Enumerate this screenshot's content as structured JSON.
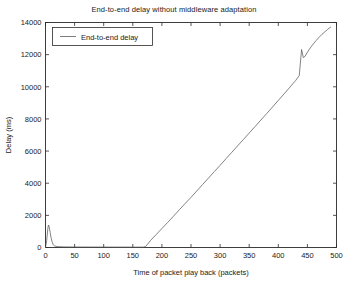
{
  "chart_data": {
    "type": "line",
    "title": "End-to-end delay without middleware adaptation",
    "xlabel": "Time of packet play back (packets)",
    "ylabel": "Delay (ms)",
    "xlim": [
      0,
      500
    ],
    "ylim": [
      0,
      14000
    ],
    "xticks": [
      0,
      50,
      100,
      150,
      200,
      250,
      300,
      350,
      400,
      450,
      500
    ],
    "yticks": [
      0,
      2000,
      4000,
      6000,
      8000,
      10000,
      12000,
      14000
    ],
    "grid": false,
    "legend_position": "top-left",
    "series": [
      {
        "name": "End-to-end delay",
        "color": "#5a5a5a",
        "x": [
          0,
          2,
          4,
          5,
          6,
          7,
          8,
          9,
          10,
          11,
          12,
          13,
          14,
          16,
          20,
          30,
          40,
          50,
          60,
          70,
          80,
          90,
          100,
          110,
          120,
          130,
          140,
          150,
          160,
          168,
          172,
          176,
          180,
          190,
          200,
          210,
          220,
          230,
          240,
          250,
          260,
          270,
          280,
          290,
          300,
          310,
          320,
          330,
          340,
          350,
          360,
          370,
          380,
          390,
          400,
          410,
          420,
          430,
          436,
          440,
          443,
          446,
          450,
          455,
          460,
          465,
          470,
          475,
          480,
          485,
          490
        ],
        "y": [
          0,
          420,
          1180,
          1400,
          1330,
          1150,
          930,
          720,
          540,
          400,
          290,
          200,
          140,
          90,
          55,
          40,
          35,
          32,
          30,
          30,
          28,
          28,
          27,
          26,
          26,
          25,
          25,
          24,
          24,
          24,
          60,
          230,
          420,
          800,
          1180,
          1560,
          1950,
          2350,
          2740,
          3120,
          3520,
          3920,
          4320,
          4720,
          5110,
          5520,
          5920,
          6320,
          6720,
          7120,
          7520,
          7930,
          8330,
          8740,
          9150,
          9560,
          9980,
          10400,
          10700,
          12320,
          11820,
          11900,
          12150,
          12420,
          12660,
          12880,
          13080,
          13260,
          13420,
          13580,
          13720
        ]
      }
    ]
  }
}
